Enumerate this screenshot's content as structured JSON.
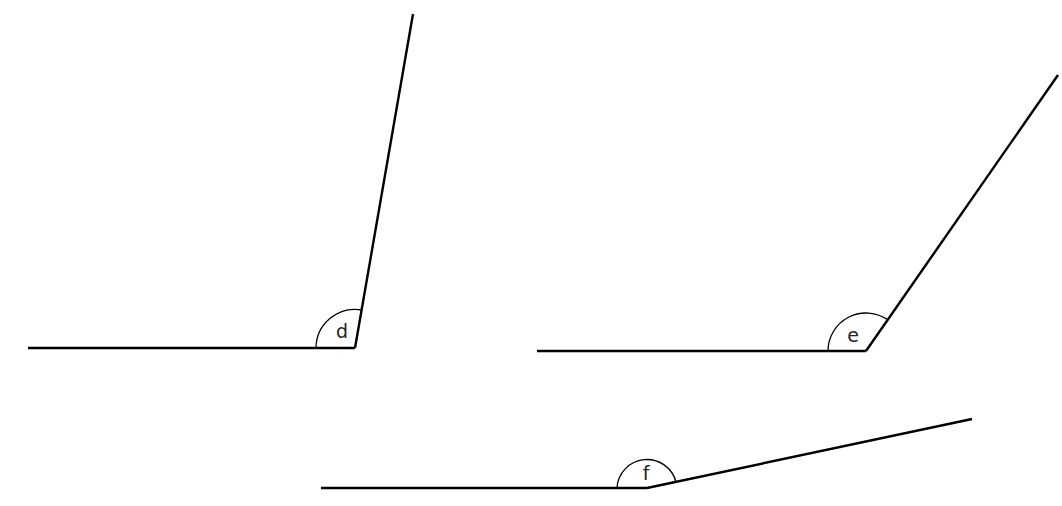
{
  "diagram": {
    "title": "",
    "angles": [
      {
        "label": "d",
        "vertex": [
          355,
          348
        ],
        "arm1_end": [
          28,
          348
        ],
        "arm2_end": [
          413,
          14
        ],
        "arc": "M 316 348 A 39 39 0 0 1 362 310",
        "label_pos": [
          342,
          338
        ]
      },
      {
        "label": "e",
        "vertex": [
          866,
          351
        ],
        "arm1_end": [
          537,
          351
        ],
        "arm2_end": [
          1058,
          75
        ],
        "arc": "M 828 351 A 38 38 0 0 1 888 320",
        "label_pos": [
          853,
          342
        ]
      },
      {
        "label": "f",
        "vertex": [
          647,
          488
        ],
        "arm1_end": [
          321,
          488
        ],
        "arm2_end": [
          972,
          419
        ],
        "arc": "M 617 488 A 30 30 0 0 1 676 482",
        "label_pos": [
          646,
          480
        ]
      }
    ]
  }
}
